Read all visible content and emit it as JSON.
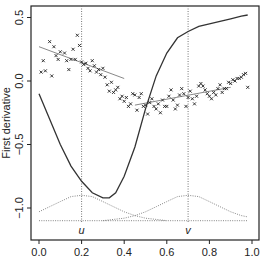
{
  "chart_data": {
    "type": "scatter",
    "title": "",
    "xlabel": "",
    "ylabel": "First derivative",
    "xlim": [
      -0.04,
      1.04
    ],
    "ylim": [
      -1.25,
      0.6
    ],
    "grid": false,
    "legend": null,
    "x_ticks": [
      0.0,
      0.2,
      0.4,
      0.6,
      0.8,
      1.0
    ],
    "x_tick_labels": [
      "0.0",
      "0.2",
      "0.4",
      "0.6",
      "0.8",
      "1.0"
    ],
    "y_ticks": [
      0.5,
      0.0,
      -0.5,
      -1.0
    ],
    "y_tick_labels": [
      "0.5",
      "0.0",
      "−0.5",
      "−1.0"
    ],
    "vertical_markers": [
      {
        "x": 0.2,
        "label": "u"
      },
      {
        "x": 0.7,
        "label": "v"
      }
    ],
    "series": [
      {
        "name": "observations",
        "kind": "points",
        "marker": "x",
        "points": [
          [
            0.01,
            0.07
          ],
          [
            0.02,
            0.16
          ],
          [
            0.03,
            0.08
          ],
          [
            0.05,
            0.31
          ],
          [
            0.06,
            0.04
          ],
          [
            0.07,
            0.27
          ],
          [
            0.08,
            0.2
          ],
          [
            0.09,
            0.17
          ],
          [
            0.1,
            0.23
          ],
          [
            0.12,
            0.22
          ],
          [
            0.13,
            0.16
          ],
          [
            0.14,
            0.09
          ],
          [
            0.15,
            0.17
          ],
          [
            0.16,
            0.25
          ],
          [
            0.17,
            0.17
          ],
          [
            0.18,
            0.36
          ],
          [
            0.19,
            0.28
          ],
          [
            0.2,
            0.15
          ],
          [
            0.21,
            0.13
          ],
          [
            0.22,
            0.14
          ],
          [
            0.23,
            0.1
          ],
          [
            0.24,
            0.08
          ],
          [
            0.25,
            0.16
          ],
          [
            0.26,
            0.12
          ],
          [
            0.27,
            0.07
          ],
          [
            0.28,
            0.09
          ],
          [
            0.29,
            0.05
          ],
          [
            0.3,
            0.1
          ],
          [
            0.31,
            0.03
          ],
          [
            0.32,
            -0.03
          ],
          [
            0.33,
            -0.08
          ],
          [
            0.34,
            -0.01
          ],
          [
            0.35,
            -0.09
          ],
          [
            0.36,
            -0.07
          ],
          [
            0.37,
            -0.05
          ],
          [
            0.38,
            -0.14
          ],
          [
            0.39,
            -0.12
          ],
          [
            0.4,
            -0.16
          ],
          [
            0.41,
            -0.13
          ],
          [
            0.42,
            -0.2
          ],
          [
            0.43,
            -0.18
          ],
          [
            0.44,
            -0.1
          ],
          [
            0.45,
            -0.11
          ],
          [
            0.46,
            -0.23
          ],
          [
            0.47,
            -0.13
          ],
          [
            0.48,
            -0.1
          ],
          [
            0.49,
            -0.2
          ],
          [
            0.5,
            -0.19
          ],
          [
            0.51,
            -0.26
          ],
          [
            0.52,
            -0.17
          ],
          [
            0.53,
            -0.14
          ],
          [
            0.54,
            -0.2
          ],
          [
            0.55,
            -0.22
          ],
          [
            0.56,
            -0.18
          ],
          [
            0.57,
            -0.25
          ],
          [
            0.58,
            -0.15
          ],
          [
            0.59,
            -0.2
          ],
          [
            0.6,
            -0.2
          ],
          [
            0.61,
            -0.12
          ],
          [
            0.62,
            -0.07
          ],
          [
            0.63,
            -0.15
          ],
          [
            0.64,
            -0.22
          ],
          [
            0.65,
            -0.19
          ],
          [
            0.66,
            -0.11
          ],
          [
            0.67,
            -0.06
          ],
          [
            0.68,
            -0.1
          ],
          [
            0.69,
            -0.2
          ],
          [
            0.7,
            -0.13
          ],
          [
            0.71,
            -0.08
          ],
          [
            0.72,
            -0.14
          ],
          [
            0.73,
            -0.18
          ],
          [
            0.74,
            -0.12
          ],
          [
            0.75,
            -0.04
          ],
          [
            0.76,
            -0.02
          ],
          [
            0.77,
            -0.04
          ],
          [
            0.78,
            -0.07
          ],
          [
            0.79,
            -0.1
          ],
          [
            0.8,
            -0.12
          ],
          [
            0.81,
            -0.14
          ],
          [
            0.82,
            -0.09
          ],
          [
            0.83,
            -0.11
          ],
          [
            0.84,
            -0.06
          ],
          [
            0.85,
            -0.03
          ],
          [
            0.86,
            -0.09
          ],
          [
            0.87,
            -0.06
          ],
          [
            0.88,
            -0.06
          ],
          [
            0.89,
            -0.01
          ],
          [
            0.9,
            -0.02
          ],
          [
            0.91,
            0.01
          ],
          [
            0.92,
            0.0
          ],
          [
            0.93,
            0.02
          ],
          [
            0.94,
            0.02
          ],
          [
            0.95,
            0.03
          ],
          [
            0.96,
            0.05
          ],
          [
            0.97,
            0.06
          ],
          [
            0.98,
            -0.05
          ]
        ]
      },
      {
        "name": "local linear fit at u",
        "kind": "line",
        "style": "thin",
        "x": [
          0.0,
          0.4
        ],
        "y": [
          0.27,
          0.02
        ]
      },
      {
        "name": "local linear fit at v",
        "kind": "line",
        "style": "thin",
        "x": [
          0.45,
          0.9
        ],
        "y": [
          -0.19,
          -0.05
        ]
      },
      {
        "name": "true first derivative",
        "kind": "line",
        "style": "solid",
        "x": [
          0.0,
          0.05,
          0.1,
          0.15,
          0.2,
          0.25,
          0.3,
          0.33,
          0.36,
          0.4,
          0.45,
          0.5,
          0.55,
          0.6,
          0.65,
          0.7,
          0.75,
          0.8,
          0.85,
          0.9,
          0.95,
          0.98
        ],
        "y": [
          -0.1,
          -0.3,
          -0.5,
          -0.67,
          -0.79,
          -0.88,
          -0.92,
          -0.92,
          -0.88,
          -0.75,
          -0.52,
          -0.22,
          0.04,
          0.22,
          0.34,
          0.39,
          0.43,
          0.45,
          0.47,
          0.49,
          0.51,
          0.52
        ]
      },
      {
        "name": "kernel weight at u",
        "kind": "line",
        "style": "dotted",
        "x": [
          0.0,
          0.05,
          0.1,
          0.15,
          0.2,
          0.25,
          0.3,
          0.35,
          0.4,
          0.45,
          0.5,
          0.55,
          0.6
        ],
        "y": [
          -1.03,
          -0.99,
          -0.95,
          -0.91,
          -0.9,
          -0.91,
          -0.95,
          -0.99,
          -1.03,
          -1.06,
          -1.08,
          -1.09,
          -1.1
        ]
      },
      {
        "name": "kernel weight at v",
        "kind": "line",
        "style": "dotted",
        "x": [
          0.3,
          0.35,
          0.4,
          0.45,
          0.5,
          0.55,
          0.6,
          0.65,
          0.7,
          0.75,
          0.8,
          0.85,
          0.9,
          0.95,
          0.98
        ],
        "y": [
          -1.1,
          -1.09,
          -1.08,
          -1.06,
          -1.03,
          -0.99,
          -0.95,
          -0.91,
          -0.9,
          -0.91,
          -0.95,
          -0.99,
          -1.03,
          -1.06,
          -1.07
        ]
      },
      {
        "name": "kernel baseline",
        "kind": "line",
        "style": "dotted",
        "x": [
          0.0,
          0.98
        ],
        "y": [
          -1.1,
          -1.1
        ]
      }
    ]
  }
}
